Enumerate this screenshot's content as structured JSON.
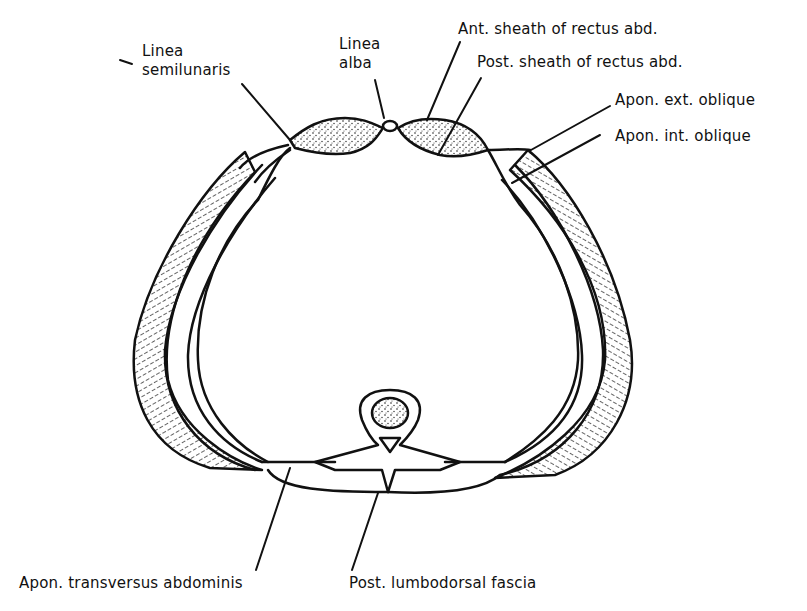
{
  "figure": {
    "colors": {
      "ink": "#111111",
      "background": "#ffffff"
    }
  },
  "labels": {
    "linea_semilunaris": {
      "line1": "Linea",
      "line2": "semilunaris"
    },
    "linea_alba": {
      "line1": "Linea",
      "line2": "alba"
    },
    "ant_sheath": "Ant. sheath of rectus abd.",
    "post_sheath": "Post. sheath of rectus abd.",
    "apon_ext_oblique": "Apon. ext. oblique",
    "apon_int_oblique": "Apon. int. oblique",
    "apon_transversus": "Apon. transversus abdominis",
    "post_lumbodorsal": "Post. lumbodorsal fascia"
  }
}
